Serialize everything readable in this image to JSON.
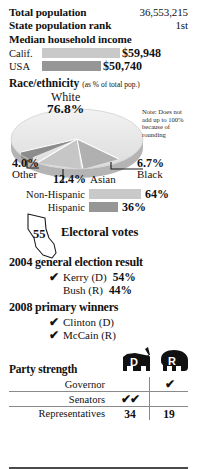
{
  "stats": [
    {
      "label": "Total population",
      "value": "36,553,215"
    },
    {
      "label": "State population rank",
      "value": "1st"
    }
  ],
  "income": {
    "heading": "Median household income",
    "rows": [
      {
        "label": "Calif.",
        "value": "$59,948",
        "pct": 100
      },
      {
        "label": "USA",
        "value": "$50,740",
        "pct": 76
      }
    ]
  },
  "race": {
    "heading": "Race/ethnicity",
    "subheading": "(as % of total pop.)",
    "note": "Note: Does not add up to 100% because of rounding",
    "slices": [
      {
        "name": "White",
        "pct": "76.8%",
        "value": 76.8
      },
      {
        "name": "Black",
        "pct": "6.7%",
        "value": 6.7
      },
      {
        "name": "Asian",
        "pct": "12.4%",
        "value": 12.4
      },
      {
        "name": "Other",
        "pct": "4.0%",
        "value": 4.0
      }
    ]
  },
  "hispanic": {
    "rows": [
      {
        "label": "Non-Hispanic",
        "value": "64%",
        "pct": 64
      },
      {
        "label": "Hispanic",
        "value": "36%",
        "pct": 36
      }
    ]
  },
  "electoral": {
    "votes": "55",
    "label": "Electoral votes"
  },
  "general_2004": {
    "heading": "2004 general election result",
    "rows": [
      {
        "check": "✔",
        "name": "Kerry (D)",
        "pct": "54%"
      },
      {
        "check": "",
        "name": "Bush (R)",
        "pct": "44%"
      }
    ]
  },
  "primary_2008": {
    "heading": "2008 primary winners",
    "rows": [
      {
        "check": "✔",
        "name": "Clinton (D)"
      },
      {
        "check": "✔",
        "name": "McCain (R)"
      }
    ]
  },
  "party_strength": {
    "heading": "Party strength",
    "columns": [
      {
        "key": "D",
        "icon": "donkey-icon"
      },
      {
        "key": "R",
        "icon": "elephant-icon"
      }
    ],
    "rows": [
      {
        "name": "Governor",
        "d": "",
        "r": "✔"
      },
      {
        "name": "Senators",
        "d": "✔✔",
        "r": ""
      },
      {
        "name": "Representatives",
        "d": "34",
        "r": "19"
      }
    ]
  },
  "colors": {
    "bar_light": "#c9c9c9",
    "bar_dark": "#969696",
    "rule": "#4a4a4a"
  }
}
